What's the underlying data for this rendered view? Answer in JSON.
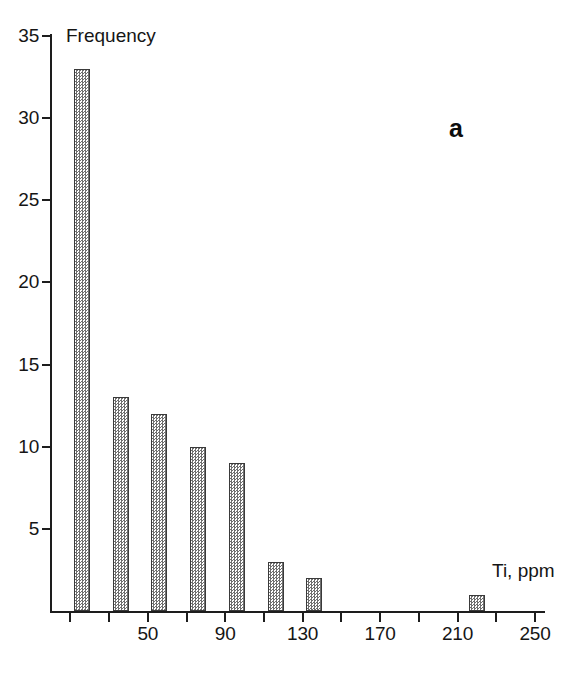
{
  "chart_data": {
    "type": "bar",
    "title": "",
    "subtitle": "",
    "panel_label": "a",
    "xlabel": "Ti, ppm",
    "ylabel": "Frequency",
    "xlim": [
      0,
      250
    ],
    "ylim": [
      0,
      35
    ],
    "grid": false,
    "legend": null,
    "bin_width": 20,
    "x": [
      16,
      36,
      56,
      76,
      96,
      116,
      136,
      220
    ],
    "values": [
      33,
      13,
      12,
      10,
      9,
      3,
      2,
      1
    ],
    "categories": [
      "16",
      "36",
      "56",
      "76",
      "96",
      "116",
      "136",
      "220"
    ],
    "x_ticks": [
      10,
      30,
      50,
      70,
      90,
      110,
      130,
      150,
      170,
      190,
      210,
      230,
      250
    ],
    "x_tick_labels": [
      "",
      "",
      "50",
      "",
      "90",
      "",
      "130",
      "",
      "170",
      "",
      "210",
      "",
      "250"
    ],
    "y_ticks": [
      5,
      10,
      15,
      20,
      25,
      30,
      35
    ],
    "y_tick_labels": [
      "5",
      "10",
      "15",
      "20",
      "25",
      "30",
      "35"
    ],
    "bar_fill": "#6f6f6f",
    "bar_edge": "#3a3a3a",
    "axis_color": "#1d1d1d"
  },
  "axes": {
    "y_title": "Frequency",
    "x_title": "Ti, ppm"
  },
  "annotations": {
    "panel": "a"
  }
}
